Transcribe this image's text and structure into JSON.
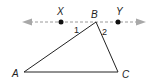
{
  "diagram": {
    "type": "geometry",
    "line": {
      "color": "#9a9a9a",
      "style": "dashed",
      "arrowheads": "both",
      "points": [
        "X",
        "B",
        "Y"
      ]
    },
    "points": {
      "X": {
        "label": "X"
      },
      "B": {
        "label": "B"
      },
      "Y": {
        "label": "Y"
      },
      "A": {
        "label": "A"
      },
      "C": {
        "label": "C"
      }
    },
    "angles": {
      "angle1": {
        "label": "1"
      },
      "angle2": {
        "label": "2"
      }
    },
    "triangle": {
      "vertices": [
        "A",
        "B",
        "C"
      ],
      "stroke": "#222222"
    }
  }
}
